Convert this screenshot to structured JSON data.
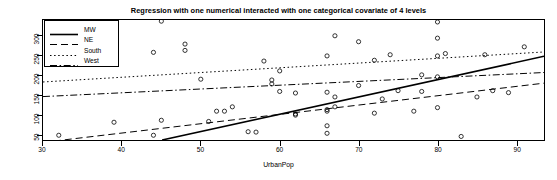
{
  "chart_data": {
    "type": "scatter",
    "title": "Regression with one numerical interacted with one categorical covariate of 4 levels",
    "xlabel": "UrbanPop",
    "ylabel": "Assault",
    "xlim": [
      30.0,
      93.5
    ],
    "ylim": [
      36.0,
      340.0
    ],
    "xticks": [
      30,
      40,
      50,
      60,
      70,
      80,
      90
    ],
    "yticks": [
      50,
      100,
      150,
      200,
      250,
      300
    ],
    "grid": false,
    "legend_position": "top-left",
    "marker": "open-circle",
    "legend": [
      {
        "name": "MW",
        "linestyle": "solid"
      },
      {
        "name": "NE",
        "linestyle": "dashed"
      },
      {
        "name": "South",
        "linestyle": "dotted"
      },
      {
        "name": "West",
        "linestyle": "dashdot"
      }
    ],
    "series": [
      {
        "name": "MW",
        "linestyle": "solid",
        "fit_line": {
          "x": [
            45.1,
            93.5
          ],
          "y": [
            36.0,
            248.0
          ]
        },
        "points": [
          {
            "x": 62.0,
            "y": 102.0
          },
          {
            "x": 62.0,
            "y": 99.0
          },
          {
            "x": 66.0,
            "y": 109.0
          },
          {
            "x": 66.0,
            "y": 113.0
          },
          {
            "x": 67.0,
            "y": 120.0
          },
          {
            "x": 70.0,
            "y": 174.0
          },
          {
            "x": 73.0,
            "y": 140.0
          },
          {
            "x": 78.0,
            "y": 201.0
          },
          {
            "x": 80.0,
            "y": 196.0
          },
          {
            "x": 59.0,
            "y": 178.0
          },
          {
            "x": 66.0,
            "y": 72.0
          },
          {
            "x": 66.0,
            "y": 53.0
          },
          {
            "x": 72.0,
            "y": 104.0
          },
          {
            "x": 77.0,
            "y": 109.0
          },
          {
            "x": 80.0,
            "y": 118.0
          }
        ]
      },
      {
        "name": "NE",
        "linestyle": "dashed",
        "fit_line": {
          "x": [
            30.0,
            93.5
          ],
          "y": [
            30.0,
            180.0
          ]
        },
        "points": [
          {
            "x": 44.0,
            "y": 48.0
          },
          {
            "x": 51.0,
            "y": 83.0
          },
          {
            "x": 52.0,
            "y": 109.0
          },
          {
            "x": 53.0,
            "y": 109.0
          },
          {
            "x": 54.0,
            "y": 120.0
          },
          {
            "x": 56.0,
            "y": 57.0
          },
          {
            "x": 57.0,
            "y": 56.0
          },
          {
            "x": 85.0,
            "y": 145.0
          },
          {
            "x": 87.0,
            "y": 161.0
          },
          {
            "x": 89.0,
            "y": 156.0
          },
          {
            "x": 83.0,
            "y": 45.0
          }
        ]
      },
      {
        "name": "South",
        "linestyle": "dotted",
        "fit_line": {
          "x": [
            30.0,
            93.5
          ],
          "y": [
            183.0,
            259.0
          ]
        },
        "points": [
          {
            "x": 45.0,
            "y": 337.0
          },
          {
            "x": 48.0,
            "y": 279.0
          },
          {
            "x": 48.0,
            "y": 263.0
          },
          {
            "x": 44.0,
            "y": 258.0
          },
          {
            "x": 58.0,
            "y": 236.0
          },
          {
            "x": 59.0,
            "y": 188.0
          },
          {
            "x": 60.0,
            "y": 211.0
          },
          {
            "x": 66.0,
            "y": 249.0
          },
          {
            "x": 67.0,
            "y": 300.0
          },
          {
            "x": 70.0,
            "y": 285.0
          },
          {
            "x": 72.0,
            "y": 238.0
          },
          {
            "x": 74.0,
            "y": 252.0
          },
          {
            "x": 80.0,
            "y": 335.0
          },
          {
            "x": 80.0,
            "y": 294.0
          },
          {
            "x": 80.0,
            "y": 249.0
          },
          {
            "x": 86.0,
            "y": 252.0
          },
          {
            "x": 91.0,
            "y": 272.0
          },
          {
            "x": 50.0,
            "y": 190.0
          },
          {
            "x": 60.0,
            "y": 159.0
          },
          {
            "x": 62.0,
            "y": 155.0
          },
          {
            "x": 39.0,
            "y": 81.0
          },
          {
            "x": 45.0,
            "y": 86.0
          },
          {
            "x": 32.0,
            "y": 48.0
          }
        ]
      },
      {
        "name": "West",
        "linestyle": "dashdot",
        "fit_line": {
          "x": [
            30.0,
            93.5
          ],
          "y": [
            146.0,
            207.0
          ]
        },
        "points": [
          {
            "x": 66.0,
            "y": 157.0
          },
          {
            "x": 67.0,
            "y": 145.0
          },
          {
            "x": 75.0,
            "y": 161.0
          },
          {
            "x": 78.0,
            "y": 159.0
          },
          {
            "x": 81.0,
            "y": 255.0
          }
        ]
      }
    ]
  }
}
